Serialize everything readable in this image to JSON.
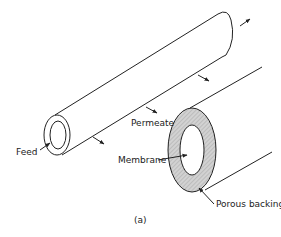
{
  "figure": {
    "caption": "(a)",
    "labels": {
      "feed": "Feed",
      "permeate": "Permeate",
      "membrane": "Membrane",
      "porous_backing": "Porous backing"
    },
    "colors": {
      "line": "#222222",
      "hatch_fill": "#cfcfcf",
      "background": "#ffffff"
    },
    "components": [
      {
        "name": "tubular membrane (small tube)",
        "role": "feed channel"
      },
      {
        "name": "membrane",
        "role": "inner layer of ring"
      },
      {
        "name": "porous backing",
        "role": "hatched outer layer"
      }
    ]
  }
}
